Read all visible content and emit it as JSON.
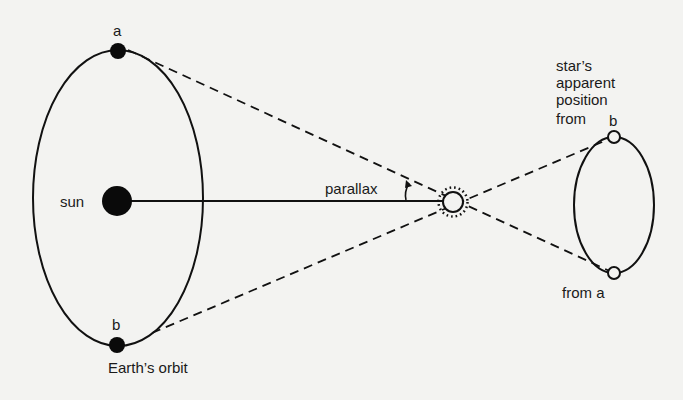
{
  "diagram": {
    "labels": {
      "earth_a": "a",
      "earth_b": "b",
      "sun": "sun",
      "orbit": "Earth’s orbit",
      "parallax": "parallax",
      "apparent_line1": "star’s",
      "apparent_line2": "apparent",
      "apparent_line3": "position",
      "apparent_line4": "from",
      "apparent_b": "b",
      "from_a": "from a"
    },
    "colors": {
      "background": "#f3f3f1",
      "ink": "#111111"
    }
  }
}
